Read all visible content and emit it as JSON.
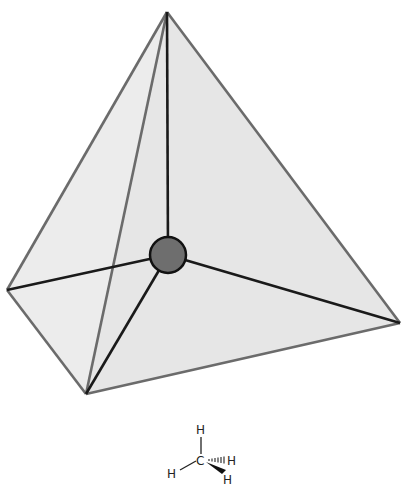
{
  "diagram": {
    "colors": {
      "face_fill": "#ececec",
      "edge": "#6b6b6b",
      "bond": "#1a1a1a",
      "atom_fill": "#6e6e6e",
      "atom_stroke": "#111111"
    },
    "vertices": {
      "apex": [
        167,
        12
      ],
      "left": [
        7,
        290
      ],
      "right": [
        400,
        323
      ],
      "front": [
        86,
        394
      ],
      "center": [
        168,
        255
      ]
    },
    "center_atom_radius": 18
  },
  "formula": {
    "central_atom": "C",
    "top_h": "H",
    "left_h": "H",
    "hashed_h": "H",
    "wedge_h": "H"
  }
}
